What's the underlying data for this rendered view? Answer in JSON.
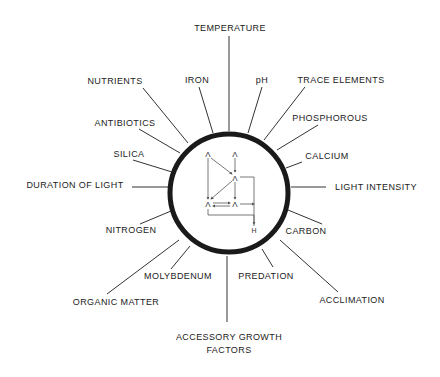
{
  "diagram": {
    "title": "",
    "center_label": "",
    "colors": {
      "ring": "#1a1a1a",
      "spokes": "#333333",
      "text": "#222222"
    },
    "factors": [
      {
        "id": "temperature",
        "label": "TEMPERATURE"
      },
      {
        "id": "iron",
        "label": "IRON"
      },
      {
        "id": "ph",
        "label": "pH"
      },
      {
        "id": "trace-elements",
        "label": "TRACE ELEMENTS"
      },
      {
        "id": "nutrients",
        "label": "NUTRIENTS"
      },
      {
        "id": "phosphorous",
        "label": "PHOSPHOROUS"
      },
      {
        "id": "antibiotics",
        "label": "ANTIBIOTICS"
      },
      {
        "id": "calcium",
        "label": "CALCIUM"
      },
      {
        "id": "silica",
        "label": "SILICA"
      },
      {
        "id": "light-intensity",
        "label": "LIGHT INTENSITY"
      },
      {
        "id": "duration-of-light",
        "label": "DURATION OF LIGHT"
      },
      {
        "id": "carbon",
        "label": "CARBON"
      },
      {
        "id": "nitrogen",
        "label": "NITROGEN"
      },
      {
        "id": "acclimation",
        "label": "ACCLIMATION"
      },
      {
        "id": "organic-matter",
        "label": "ORGANIC MATTER"
      },
      {
        "id": "molybdenum",
        "label": "MOLYBDENUM"
      },
      {
        "id": "predation",
        "label": "PREDATION"
      },
      {
        "id": "accessory-growth-factors",
        "label_line1": "ACCESSORY GROWTH",
        "label_line2": "FACTORS"
      }
    ],
    "inner_schematic": {
      "nodes": [
        "Λ",
        "Λ",
        "Λ",
        "Λ",
        "Λ",
        "H"
      ]
    }
  }
}
